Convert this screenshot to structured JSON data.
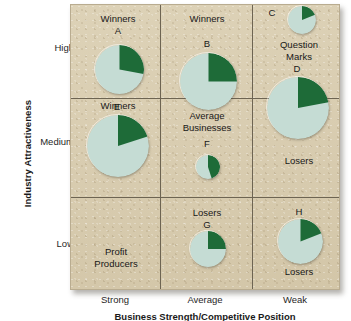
{
  "axes": {
    "y_title": "Industry Attractiveness",
    "x_title": "Business Strength/Competitive Position",
    "y_ticks": [
      "High",
      "Medium",
      "Low"
    ],
    "x_ticks": [
      "Strong",
      "Average",
      "Weak"
    ]
  },
  "colors": {
    "pie_light": "#c5dcd4",
    "pie_dark": "#1e6b38",
    "panel_bg": "#d8cdb0",
    "grid_line": "#6d6452",
    "text": "#181818"
  },
  "cells": [
    {
      "id": "cell-high-strong",
      "label": "Winners"
    },
    {
      "id": "cell-high-average",
      "label": "Winners"
    },
    {
      "id": "cell-high-weak",
      "label": "Question\nMarks"
    },
    {
      "id": "cell-medium-strong",
      "label": "Winners"
    },
    {
      "id": "cell-medium-average",
      "label": "Average\nBusinesses"
    },
    {
      "id": "cell-medium-weak",
      "label": "Losers"
    },
    {
      "id": "cell-low-strong",
      "label": "Profit\nProducers"
    },
    {
      "id": "cell-low-average",
      "label": "Losers"
    },
    {
      "id": "cell-low-weak",
      "label": "Losers"
    }
  ],
  "chart_data": {
    "type": "pie",
    "xlabel": "Business Strength/Competitive Position",
    "ylabel": "Industry Attractiveness",
    "x_categories": [
      "Strong",
      "Average",
      "Weak"
    ],
    "y_categories": [
      "High",
      "Medium",
      "Low"
    ],
    "grid": true,
    "legend": "none",
    "note": "Each circle is a business unit: circle area = industry/market size, dark green wedge = that unit's market share.",
    "series": [
      {
        "name": "A",
        "x_category": "Strong",
        "y_category": "High",
        "cell_label": "Winners",
        "share_pct": 28,
        "circle_diameter_px": 49,
        "cx": 118,
        "cy": 68
      },
      {
        "name": "B",
        "x_category": "Average",
        "y_category": "High",
        "cell_label": "Winners",
        "share_pct": 25,
        "circle_diameter_px": 57,
        "cx": 207,
        "cy": 80
      },
      {
        "name": "C",
        "x_category": "Weak",
        "y_category": "High",
        "cell_label": "Question Marks",
        "share_pct": 19,
        "circle_diameter_px": 28,
        "cx": 301,
        "cy": 19
      },
      {
        "name": "D",
        "x_category": "Weak",
        "y_category": "Medium",
        "cell_label": "Losers",
        "share_pct": 22,
        "circle_diameter_px": 62,
        "cx": 297,
        "cy": 107
      },
      {
        "name": "E",
        "x_category": "Strong",
        "y_category": "Medium",
        "cell_label": "Winners",
        "share_pct": 20,
        "circle_diameter_px": 62,
        "cx": 117,
        "cy": 145
      },
      {
        "name": "F",
        "x_category": "Average",
        "y_category": "Medium",
        "cell_label": "Average Businesses",
        "share_pct": 45,
        "circle_diameter_px": 24,
        "cx": 207,
        "cy": 166
      },
      {
        "name": "G",
        "x_category": "Average",
        "y_category": "Low",
        "cell_label": "Losers",
        "share_pct": 25,
        "circle_diameter_px": 36,
        "cx": 207,
        "cy": 248
      },
      {
        "name": "H",
        "x_category": "Weak",
        "y_category": "Low",
        "cell_label": "Losers",
        "share_pct": 19,
        "circle_diameter_px": 45,
        "cx": 299,
        "cy": 240
      }
    ]
  }
}
